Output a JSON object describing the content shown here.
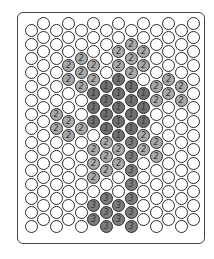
{
  "diagram": {
    "columns": 14,
    "rows": 15,
    "legend": {
      "0": {
        "label": "",
        "color": "#ffffff"
      },
      "1": {
        "label": "1",
        "color": "#6f6f6f"
      },
      "2": {
        "label": "2",
        "color": "#a9a9a9"
      },
      "3": {
        "label": "3",
        "color": "#7d7d7d"
      }
    },
    "grid_by_column": [
      [
        0,
        0,
        0,
        0,
        0,
        0,
        0,
        0,
        0,
        0,
        0,
        0,
        0,
        0,
        0
      ],
      [
        0,
        0,
        0,
        0,
        0,
        0,
        0,
        0,
        0,
        0,
        0,
        0,
        0,
        0,
        0
      ],
      [
        0,
        0,
        0,
        0,
        0,
        0,
        2,
        2,
        0,
        0,
        0,
        0,
        0,
        0,
        0
      ],
      [
        0,
        0,
        0,
        2,
        2,
        0,
        0,
        2,
        2,
        0,
        0,
        0,
        0,
        0,
        0
      ],
      [
        0,
        0,
        2,
        2,
        2,
        0,
        0,
        2,
        0,
        0,
        0,
        0,
        0,
        0,
        0
      ],
      [
        0,
        0,
        0,
        2,
        2,
        1,
        1,
        1,
        0,
        2,
        2,
        2,
        0,
        3,
        3
      ],
      [
        0,
        0,
        0,
        0,
        1,
        1,
        1,
        1,
        2,
        2,
        2,
        0,
        3,
        3,
        3
      ],
      [
        0,
        0,
        2,
        2,
        1,
        1,
        1,
        1,
        1,
        2,
        2,
        0,
        0,
        3,
        3
      ],
      [
        0,
        2,
        2,
        2,
        1,
        1,
        1,
        1,
        3,
        3,
        3,
        3,
        3,
        3,
        3
      ],
      [
        0,
        0,
        2,
        2,
        0,
        1,
        1,
        1,
        2,
        2,
        0,
        0,
        0,
        0,
        0
      ],
      [
        0,
        0,
        0,
        0,
        2,
        2,
        0,
        0,
        2,
        2,
        0,
        0,
        0,
        0,
        0
      ],
      [
        0,
        0,
        0,
        0,
        2,
        2,
        0,
        0,
        0,
        0,
        0,
        0,
        0,
        0,
        0
      ],
      [
        0,
        0,
        0,
        0,
        2,
        2,
        0,
        0,
        0,
        0,
        0,
        0,
        0,
        0,
        0
      ],
      [
        0,
        0,
        0,
        0,
        0,
        0,
        0,
        0,
        0,
        0,
        0,
        0,
        0,
        0,
        0
      ]
    ]
  }
}
